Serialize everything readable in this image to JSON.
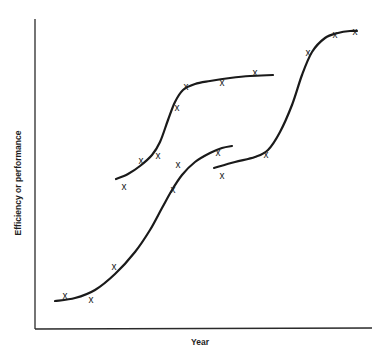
{
  "chart_data": {
    "type": "line",
    "title": "",
    "xlabel": "Year",
    "ylabel": "Efficiency or performance",
    "grid": false,
    "legend": null,
    "x_ticks": [],
    "y_ticks": [],
    "marker_glyph": "x",
    "axes": {
      "origin": [
        35,
        329
      ],
      "x_end": [
        372,
        328
      ],
      "y_top": [
        35,
        19
      ]
    },
    "series": [
      {
        "name": "S-curve 1",
        "curve_points": [
          [
            55,
            301
          ],
          [
            75,
            298
          ],
          [
            95,
            290
          ],
          [
            115,
            274
          ],
          [
            135,
            252
          ],
          [
            150,
            230
          ],
          [
            162,
            208
          ],
          [
            172,
            190
          ],
          [
            182,
            175
          ],
          [
            195,
            162
          ],
          [
            210,
            153
          ],
          [
            222,
            148
          ],
          [
            232,
            146
          ]
        ],
        "markers": [
          [
            65,
            295
          ],
          [
            91,
            299
          ],
          [
            114,
            266
          ],
          [
            173,
            189
          ],
          [
            178,
            164
          ],
          [
            218,
            152
          ]
        ]
      },
      {
        "name": "S-curve 2",
        "curve_points": [
          [
            116,
            179
          ],
          [
            128,
            174
          ],
          [
            140,
            166
          ],
          [
            152,
            155
          ],
          [
            160,
            142
          ],
          [
            168,
            120
          ],
          [
            175,
            102
          ],
          [
            183,
            90
          ],
          [
            195,
            84
          ],
          [
            210,
            81
          ],
          [
            230,
            78
          ],
          [
            250,
            76
          ],
          [
            273,
            75
          ]
        ],
        "markers": [
          [
            124,
            186
          ],
          [
            141,
            160
          ],
          [
            158,
            155
          ],
          [
            177,
            107
          ],
          [
            186,
            86
          ],
          [
            222,
            82
          ],
          [
            255,
            72
          ]
        ]
      },
      {
        "name": "S-curve 3",
        "curve_points": [
          [
            214,
            168
          ],
          [
            235,
            162
          ],
          [
            255,
            157
          ],
          [
            268,
            150
          ],
          [
            280,
            132
          ],
          [
            292,
            105
          ],
          [
            302,
            75
          ],
          [
            312,
            52
          ],
          [
            325,
            38
          ],
          [
            338,
            33
          ],
          [
            350,
            31
          ],
          [
            357,
            31
          ]
        ],
        "markers": [
          [
            222,
            175
          ],
          [
            266,
            154
          ],
          [
            308,
            52
          ],
          [
            335,
            34
          ],
          [
            355,
            31
          ]
        ]
      }
    ]
  }
}
